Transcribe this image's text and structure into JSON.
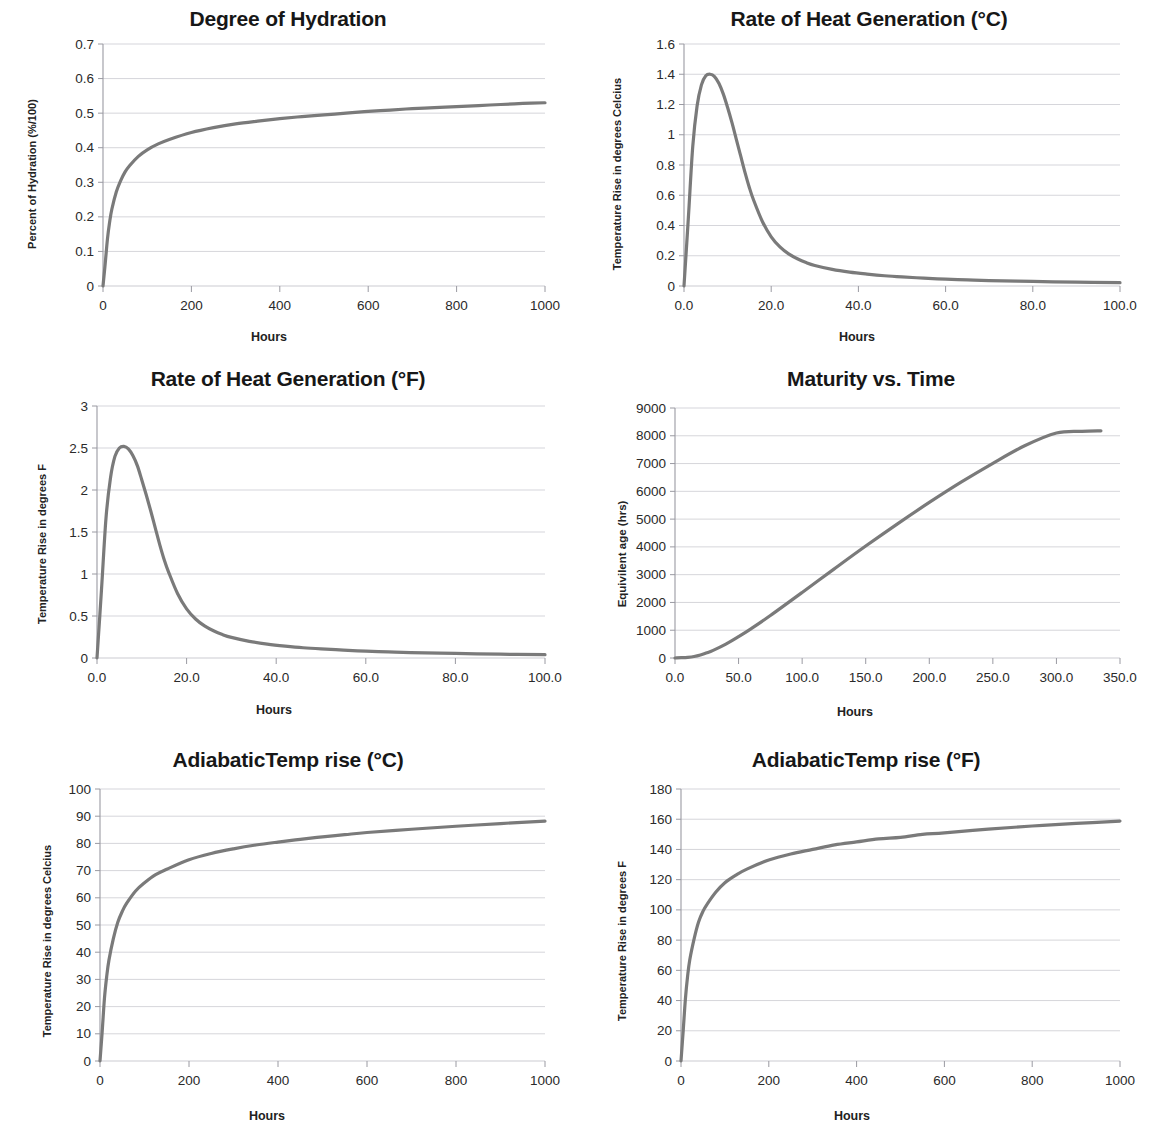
{
  "figure": {
    "background": "#ffffff",
    "line_color": "#7a7a7a",
    "grid_color": "#c9c9cf",
    "axis_color": "#9a9aa2",
    "text_color": "#1a1a1a"
  },
  "xlabel_common": "Hours",
  "charts": [
    {
      "id": "degree-of-hydration",
      "title": "Degree of Hydration",
      "ylabel": "Percent of Hydration (%/100)",
      "xlabel": "Hours",
      "xticks": [
        "0",
        "200",
        "400",
        "600",
        "800",
        "1000"
      ],
      "yticks": [
        "0",
        "0.1",
        "0.2",
        "0.3",
        "0.4",
        "0.5",
        "0.6",
        "0.7"
      ]
    },
    {
      "id": "rate-of-heat-generation-c",
      "title": "Rate of Heat Generation (°C)",
      "ylabel": "Temperature Rise in degrees Celcius",
      "xlabel": "Hours",
      "xticks": [
        "0.0",
        "20.0",
        "40.0",
        "60.0",
        "80.0",
        "100.0"
      ],
      "yticks": [
        "0",
        "0.2",
        "0.4",
        "0.6",
        "0.8",
        "1",
        "1.2",
        "1.4",
        "1.6"
      ]
    },
    {
      "id": "rate-of-heat-generation-f",
      "title": "Rate of Heat Generation (°F)",
      "ylabel": "Temperature Rise in degrees F",
      "xlabel": "Hours",
      "xticks": [
        "0.0",
        "20.0",
        "40.0",
        "60.0",
        "80.0",
        "100.0"
      ],
      "yticks": [
        "0",
        "0.5",
        "1",
        "1.5",
        "2",
        "2.5",
        "3"
      ]
    },
    {
      "id": "maturity-vs-time",
      "title": "Maturity vs. Time",
      "ylabel": "Equivilent age  (hrs)",
      "xlabel": "Hours",
      "xticks": [
        "0.0",
        "50.0",
        "100.0",
        "150.0",
        "200.0",
        "250.0",
        "300.0",
        "350.0"
      ],
      "yticks": [
        "0",
        "1000",
        "2000",
        "3000",
        "4000",
        "5000",
        "6000",
        "7000",
        "8000",
        "9000"
      ]
    },
    {
      "id": "adiabatic-temp-rise-c",
      "title": "AdiabaticTemp rise (°C)",
      "ylabel": "Temperature Rise in degrees Celcius",
      "xlabel": "Hours",
      "xticks": [
        "0",
        "200",
        "400",
        "600",
        "800",
        "1000"
      ],
      "yticks": [
        "0",
        "10",
        "20",
        "30",
        "40",
        "50",
        "60",
        "70",
        "80",
        "90",
        "100"
      ]
    },
    {
      "id": "adiabatic-temp-rise-f",
      "title": "AdiabaticTemp rise (°F)",
      "ylabel": "Temperature Rise in degrees F",
      "xlabel": "Hours",
      "xticks": [
        "0",
        "200",
        "400",
        "600",
        "800",
        "1000"
      ],
      "yticks": [
        "0",
        "20",
        "40",
        "60",
        "80",
        "100",
        "120",
        "140",
        "160",
        "180"
      ]
    }
  ],
  "chart_data": [
    {
      "type": "line",
      "title": "Degree of Hydration",
      "xlabel": "Hours",
      "ylabel": "Percent of Hydration (%/100)",
      "xlim": [
        0,
        1000
      ],
      "ylim": [
        0,
        0.7
      ],
      "grid": true,
      "legend": "none",
      "series": [
        {
          "name": "Degree of hydration",
          "x": [
            0,
            5,
            10,
            15,
            20,
            30,
            40,
            50,
            60,
            80,
            100,
            125,
            150,
            200,
            250,
            300,
            350,
            400,
            450,
            500,
            550,
            600,
            650,
            700,
            750,
            800,
            850,
            900,
            950,
            1000
          ],
          "y": [
            0.0,
            0.065,
            0.135,
            0.185,
            0.222,
            0.272,
            0.305,
            0.33,
            0.348,
            0.375,
            0.394,
            0.411,
            0.424,
            0.444,
            0.458,
            0.469,
            0.477,
            0.484,
            0.49,
            0.495,
            0.5,
            0.505,
            0.509,
            0.513,
            0.516,
            0.519,
            0.522,
            0.525,
            0.528,
            0.53
          ]
        }
      ]
    },
    {
      "type": "line",
      "title": "Rate of Heat Generation (°C)",
      "xlabel": "Hours",
      "ylabel": "Temperature Rise in degrees Celcius",
      "xlim": [
        0,
        100
      ],
      "ylim": [
        0,
        1.6
      ],
      "grid": true,
      "legend": "none",
      "series": [
        {
          "name": "Rate of heat generation (C)",
          "x": [
            0,
            1,
            2,
            3,
            4,
            5,
            6,
            7,
            8,
            9,
            10,
            11,
            12,
            13,
            14,
            15,
            16,
            18,
            20,
            22,
            24,
            26,
            28,
            30,
            34,
            38,
            42,
            46,
            50,
            55,
            60,
            65,
            70,
            80,
            90,
            100
          ],
          "y": [
            0.0,
            0.45,
            0.92,
            1.19,
            1.33,
            1.39,
            1.4,
            1.385,
            1.34,
            1.27,
            1.18,
            1.08,
            0.97,
            0.86,
            0.75,
            0.65,
            0.565,
            0.425,
            0.325,
            0.258,
            0.212,
            0.18,
            0.155,
            0.136,
            0.11,
            0.092,
            0.079,
            0.068,
            0.06,
            0.052,
            0.045,
            0.04,
            0.036,
            0.03,
            0.025,
            0.022
          ]
        }
      ]
    },
    {
      "type": "line",
      "title": "Rate of Heat Generation (°F)",
      "xlabel": "Hours",
      "ylabel": "Temperature Rise in degrees F",
      "xlim": [
        0,
        100
      ],
      "ylim": [
        0,
        3
      ],
      "grid": true,
      "legend": "none",
      "series": [
        {
          "name": "Rate of heat generation (F)",
          "x": [
            0,
            1,
            2,
            3,
            4,
            5,
            6,
            7,
            8,
            9,
            10,
            11,
            12,
            13,
            14,
            15,
            16,
            18,
            20,
            22,
            24,
            26,
            28,
            30,
            34,
            38,
            42,
            46,
            50,
            55,
            60,
            65,
            70,
            80,
            90,
            100
          ],
          "y": [
            0.0,
            0.81,
            1.66,
            2.14,
            2.4,
            2.5,
            2.52,
            2.49,
            2.41,
            2.29,
            2.12,
            1.94,
            1.75,
            1.55,
            1.35,
            1.17,
            1.02,
            0.765,
            0.585,
            0.464,
            0.382,
            0.324,
            0.279,
            0.245,
            0.198,
            0.166,
            0.142,
            0.122,
            0.108,
            0.094,
            0.081,
            0.072,
            0.065,
            0.054,
            0.045,
            0.04
          ]
        }
      ]
    },
    {
      "type": "line",
      "title": "Maturity vs. Time",
      "xlabel": "Hours",
      "ylabel": "Equivilent age  (hrs)",
      "xlim": [
        0,
        350
      ],
      "ylim": [
        0,
        9000
      ],
      "grid": true,
      "legend": "none",
      "series": [
        {
          "name": "Equivalent age",
          "x": [
            0,
            5,
            10,
            15,
            20,
            25,
            30,
            40,
            50,
            60,
            75,
            100,
            125,
            150,
            175,
            200,
            225,
            250,
            275,
            300,
            320,
            335
          ],
          "y": [
            0,
            10,
            25,
            55,
            110,
            185,
            275,
            500,
            770,
            1060,
            1530,
            2360,
            3200,
            4030,
            4830,
            5600,
            6330,
            7010,
            7640,
            8100,
            8160,
            8180
          ]
        }
      ]
    },
    {
      "type": "line",
      "title": "AdiabaticTemp rise (°C)",
      "xlabel": "Hours",
      "ylabel": "Temperature Rise in degrees Celcius",
      "xlim": [
        0,
        1000
      ],
      "ylim": [
        0,
        100
      ],
      "grid": true,
      "legend": "none",
      "series": [
        {
          "name": "Adiabatic temperature rise (C)",
          "x": [
            0,
            5,
            10,
            15,
            20,
            30,
            40,
            50,
            60,
            80,
            100,
            125,
            150,
            200,
            250,
            300,
            350,
            400,
            450,
            500,
            550,
            600,
            700,
            800,
            900,
            1000
          ],
          "y": [
            0,
            11,
            23,
            31,
            37,
            45,
            51,
            55,
            58,
            62.5,
            65.5,
            68.5,
            70.5,
            74,
            76.3,
            78,
            79.4,
            80.5,
            81.5,
            82.4,
            83.2,
            84,
            85.2,
            86.3,
            87.3,
            88.2
          ]
        }
      ]
    },
    {
      "type": "line",
      "title": "AdiabaticTemp rise (°F)",
      "xlabel": "Hours",
      "ylabel": "Temperature Rise in degrees F",
      "xlim": [
        0,
        1000
      ],
      "ylim": [
        0,
        180
      ],
      "grid": true,
      "legend": "none",
      "series": [
        {
          "name": "Adiabatic temperature rise (F)",
          "x": [
            0,
            5,
            10,
            15,
            20,
            30,
            40,
            50,
            60,
            80,
            100,
            125,
            150,
            200,
            250,
            300,
            350,
            400,
            450,
            500,
            550,
            600,
            700,
            800,
            900,
            1000
          ],
          "y": [
            0,
            20,
            41,
            56,
            67,
            81,
            92,
            99,
            104,
            112,
            118,
            123,
            127,
            133,
            137,
            140,
            143,
            145,
            147,
            148,
            150,
            151,
            153.5,
            155.5,
            157.2,
            158.8
          ]
        }
      ]
    }
  ]
}
